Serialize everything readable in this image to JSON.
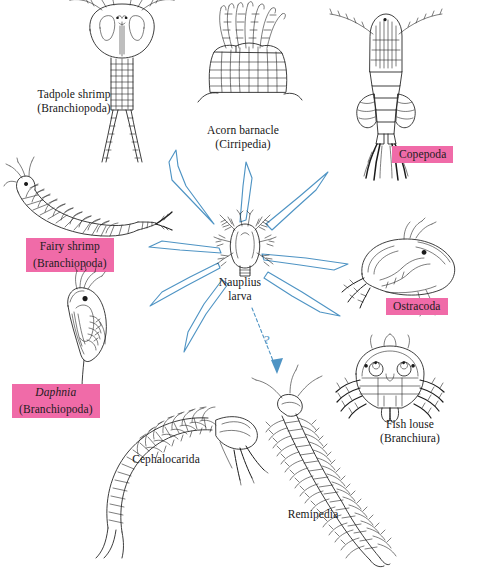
{
  "diagram": {
    "center": {
      "name": "nauplius-larva",
      "label_line1": "Nauplius",
      "label_line2": "larva"
    },
    "accent_colors": {
      "arrow_blue": "#4f94c4",
      "highlight_pink": "#f06ba8",
      "ink_black": "#1b1b1b",
      "background": "#ffffff"
    },
    "uncertain_marker": "?",
    "taxa": [
      {
        "id": "tadpole-shrimp",
        "common_name": "Tadpole shrimp",
        "group": "(Branchiopoda)",
        "highlighted": false,
        "direction": "up-left"
      },
      {
        "id": "acorn-barnacle",
        "common_name": "Acorn barnacle",
        "group": "(Cirripedia)",
        "highlighted": false,
        "direction": "up"
      },
      {
        "id": "copepoda",
        "common_name": "Copepoda",
        "group": "",
        "highlighted": true,
        "direction": "up-right"
      },
      {
        "id": "fairy-shrimp",
        "common_name": "Fairy shrimp",
        "group": "(Branchiopoda)",
        "highlighted": true,
        "direction": "left"
      },
      {
        "id": "ostracoda",
        "common_name": "Ostracoda",
        "group": "",
        "highlighted": true,
        "direction": "right"
      },
      {
        "id": "daphnia",
        "common_name": "Daphnia",
        "group": "(Branchiopoda)",
        "highlighted": true,
        "italic_name": true,
        "direction": "down-left"
      },
      {
        "id": "fish-louse",
        "common_name": "Fish louse",
        "group": "(Branchiura)",
        "highlighted": false,
        "direction": "down-right"
      },
      {
        "id": "cephalocarida",
        "common_name": "Cephalocarida",
        "group": "",
        "highlighted": false,
        "direction": "down-left-lower"
      },
      {
        "id": "remipedia",
        "common_name": "Remipedia",
        "group": "",
        "highlighted": false,
        "direction": "down",
        "uncertain": true
      }
    ]
  }
}
